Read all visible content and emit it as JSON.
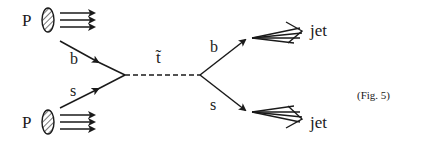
{
  "figure": {
    "caption": "(Fig. 5)",
    "proton_top_label": "P",
    "proton_bottom_label": "P",
    "incoming_quark_top": "b",
    "incoming_quark_bottom": "s",
    "propagator_label": "t̃",
    "outgoing_quark_top": "b",
    "outgoing_quark_bottom": "s",
    "jet_top_label": "jet",
    "jet_bottom_label": "jet"
  }
}
